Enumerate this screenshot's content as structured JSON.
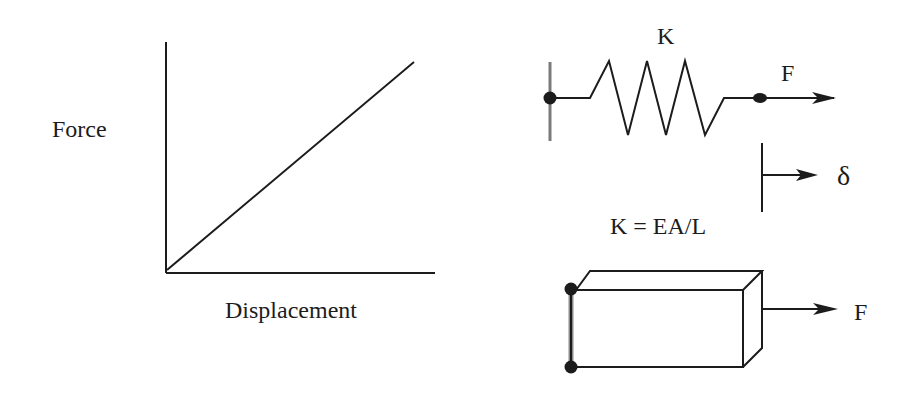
{
  "graph": {
    "y_label": "Force",
    "x_label": "Displacement"
  },
  "spring": {
    "stiffness_label": "K",
    "force_label": "F",
    "displacement_label": "δ",
    "formula": "K = EA/L"
  },
  "bar": {
    "force_label": "F"
  },
  "colors": {
    "line": "#1c1c1c",
    "wall": "#8a8a8a"
  }
}
